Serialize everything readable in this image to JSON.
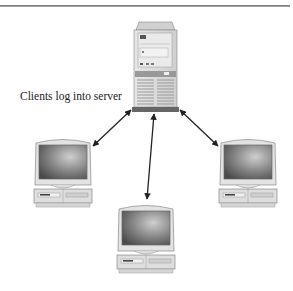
{
  "diagram": {
    "caption": "Clients log into server",
    "nodes": [
      {
        "id": "server",
        "type": "server-tower"
      },
      {
        "id": "client-left",
        "type": "desktop-computer"
      },
      {
        "id": "client-bottom",
        "type": "desktop-computer"
      },
      {
        "id": "client-right",
        "type": "desktop-computer"
      }
    ],
    "edges": [
      {
        "from": "server",
        "to": "client-left",
        "bidirectional": true
      },
      {
        "from": "server",
        "to": "client-bottom",
        "bidirectional": true
      },
      {
        "from": "server",
        "to": "client-right",
        "bidirectional": true
      }
    ],
    "colors": {
      "arrow": "#222222",
      "equipment": "#d8d8d8",
      "screen": "#6a6a6a"
    }
  }
}
